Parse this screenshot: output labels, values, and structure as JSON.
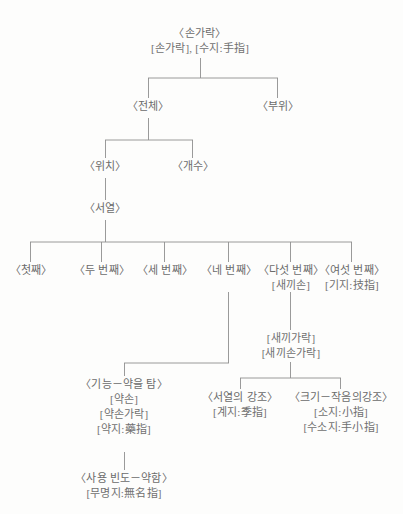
{
  "diagram": {
    "title_node": "root",
    "type": "tree-diagram",
    "language": "ko",
    "line_color": "#8e8e8e",
    "text_color": "#6b6b6b",
    "background": "#fdfdfc",
    "nodes": {
      "root": {
        "l1": "〈손가락〉",
        "l2": "[손가락], [수지:手指]"
      },
      "whole": {
        "l1": "〈전체〉"
      },
      "part": {
        "l1": "〈부위〉"
      },
      "position": {
        "l1": "〈위치〉"
      },
      "count": {
        "l1": "〈개수〉"
      },
      "order": {
        "l1": "〈서열〉"
      },
      "ord1": {
        "l1": "〈첫째〉"
      },
      "ord2": {
        "l1": "〈두 번째〉"
      },
      "ord3": {
        "l1": "〈세 번째〉"
      },
      "ord4": {
        "l1": "〈네 번째〉"
      },
      "ord5": {
        "l1": "〈다섯 번째〉",
        "l2": "[새끼손]"
      },
      "ord6": {
        "l1": "〈여섯 번째〉",
        "l2": "[기지:技指]"
      },
      "pinky": {
        "l1": "[새끼가락]",
        "l2": "[새끼손가락]"
      },
      "function_ring": {
        "l1": "〈기능－약을 탐〉",
        "l2": "[약손]",
        "l3": "[약손가락]",
        "l4": "[약지:藥指]"
      },
      "usage_weak": {
        "l1": "〈사용 빈도－약함〉",
        "l2": "[무명지:無名指]"
      },
      "order_emphasis": {
        "l1": "〈서열의 강조〉",
        "l2": "[계지:季指]"
      },
      "size_emphasis": {
        "l1": "〈크기－작음의강조〉",
        "l2": "[소지:小指]",
        "l3": "[수소지:手小指]"
      }
    }
  }
}
